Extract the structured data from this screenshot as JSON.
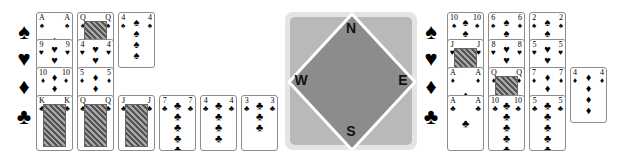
{
  "suit_symbols": {
    "spades": "♠",
    "hearts": "♥",
    "diamonds": "♦",
    "clubs": "♣"
  },
  "west_hand": {
    "spades": [
      "A",
      "Q",
      "4"
    ],
    "hearts": [
      "9",
      "4"
    ],
    "diamonds": [
      "10",
      "5"
    ],
    "clubs": [
      "K",
      "Q",
      "J",
      "7",
      "4",
      "3"
    ]
  },
  "east_hand": {
    "spades": [
      "10",
      "6",
      "2"
    ],
    "hearts": [
      "J",
      "8",
      "5"
    ],
    "diamonds": [
      "A",
      "Q",
      "7",
      "4"
    ],
    "clubs": [
      "A",
      "10",
      "5"
    ]
  },
  "compass": {
    "north": "N",
    "south": "S",
    "east": "E",
    "west": "W"
  },
  "colors": {
    "outer": "#e4e4e4",
    "inner": "#b9b9b9",
    "diamond": "#8c8c8c",
    "border": "#ffffff"
  }
}
